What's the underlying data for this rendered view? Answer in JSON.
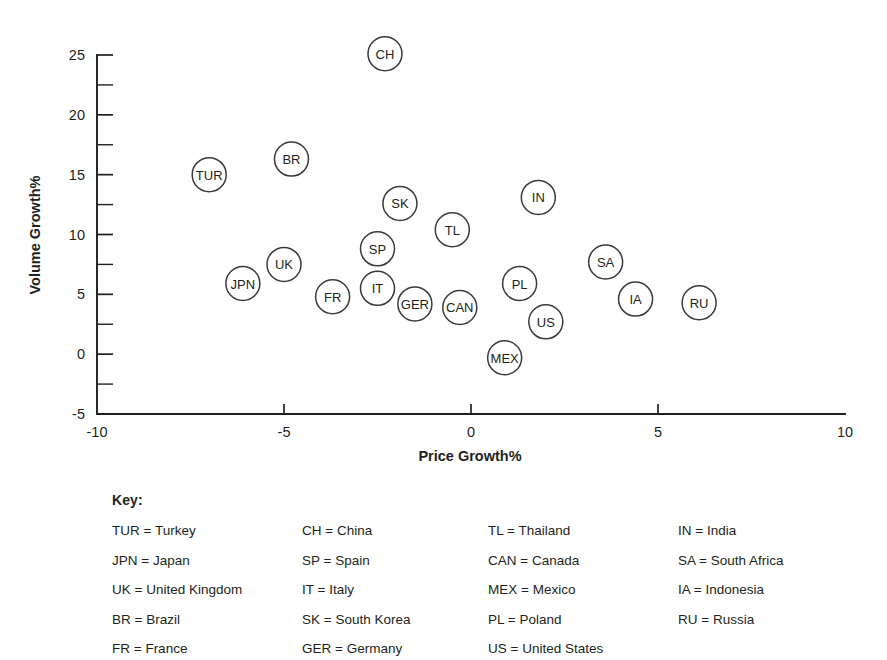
{
  "chart_data": {
    "type": "scatter",
    "title": "",
    "xlabel": "Price Growth%",
    "ylabel": "Volume Growth%",
    "xlim": [
      -10,
      10
    ],
    "ylim": [
      -5,
      25
    ],
    "x_ticks": [
      -10,
      -5,
      0,
      5,
      10
    ],
    "y_ticks": [
      -5,
      0,
      5,
      10,
      15,
      20,
      25
    ],
    "y_minor_ticks": [
      -2.5,
      2.5,
      7.5,
      12.5,
      17.5,
      22.5
    ],
    "grid": false,
    "legend_position": "below-plot",
    "marker": "open-circle-with-code-label",
    "points": [
      {
        "code": "CH",
        "x": -2.3,
        "y": 25.1
      },
      {
        "code": "BR",
        "x": -4.8,
        "y": 16.3
      },
      {
        "code": "TUR",
        "x": -7.0,
        "y": 15.0
      },
      {
        "code": "IN",
        "x": 1.8,
        "y": 13.1
      },
      {
        "code": "SK",
        "x": -1.9,
        "y": 12.6
      },
      {
        "code": "TL",
        "x": -0.5,
        "y": 10.4
      },
      {
        "code": "SP",
        "x": -2.5,
        "y": 8.8
      },
      {
        "code": "SA",
        "x": 3.6,
        "y": 7.7
      },
      {
        "code": "UK",
        "x": -5.0,
        "y": 7.5
      },
      {
        "code": "JPN",
        "x": -6.1,
        "y": 5.9
      },
      {
        "code": "PL",
        "x": 1.3,
        "y": 5.9
      },
      {
        "code": "IT",
        "x": -2.5,
        "y": 5.5
      },
      {
        "code": "FR",
        "x": -3.7,
        "y": 4.8
      },
      {
        "code": "IA",
        "x": 4.4,
        "y": 4.6
      },
      {
        "code": "RU",
        "x": 6.1,
        "y": 4.3
      },
      {
        "code": "GER",
        "x": -1.5,
        "y": 4.2
      },
      {
        "code": "CAN",
        "x": -0.3,
        "y": 3.9
      },
      {
        "code": "US",
        "x": 2.0,
        "y": 2.7
      },
      {
        "code": "MEX",
        "x": 0.9,
        "y": -0.3
      }
    ]
  },
  "key": {
    "title": "Key:",
    "columns": [
      [
        "TUR = Turkey",
        "JPN = Japan",
        "UK = United Kingdom",
        "BR = Brazil",
        "FR = France"
      ],
      [
        "CH = China",
        "SP = Spain",
        "IT = Italy",
        "SK = South Korea",
        "GER = Germany"
      ],
      [
        "TL = Thailand",
        "CAN = Canada",
        "MEX = Mexico",
        "PL = Poland",
        "US = United States"
      ],
      [
        "IN = India",
        "SA = South Africa",
        "IA = Indonesia",
        "RU = Russia"
      ]
    ]
  },
  "colors": {
    "ink": "#231f20",
    "marker_stroke": "#3b3b3f",
    "background": "#ffffff"
  }
}
